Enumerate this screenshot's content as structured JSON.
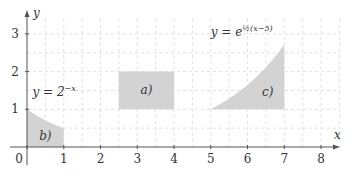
{
  "chart_data": {
    "type": "area",
    "title": "",
    "xlabel": "x",
    "ylabel": "y",
    "xlim": [
      0,
      8.5
    ],
    "ylim": [
      0,
      3.4
    ],
    "x_ticks": [
      "0",
      "1",
      "2",
      "3",
      "4",
      "5",
      "6",
      "7",
      "8"
    ],
    "y_ticks": [
      "1",
      "2",
      "3"
    ],
    "grid": {
      "on": true,
      "style": "dashed",
      "step": 0.5
    },
    "colors": {
      "fill": "#d3d3d3",
      "grid": "#e0e0e0",
      "axis": "#555555"
    },
    "regions": [
      {
        "label": "a)",
        "shape": "rectangle",
        "x": [
          2.5,
          4
        ],
        "y": [
          1,
          2
        ]
      },
      {
        "label": "b)",
        "shape": "under-curve",
        "curve": "y = 2^-x",
        "x": [
          0,
          1
        ],
        "y_bottom": 0
      },
      {
        "label": "c)",
        "shape": "between-curve-and-line",
        "curve": "y = e^(1/2 (x-5))",
        "x": [
          5,
          7
        ],
        "y_bottom": 1
      }
    ],
    "annotations": [
      {
        "text": "y = 2",
        "sup": "−x",
        "x": 0.15,
        "y": 1.35
      },
      {
        "text": "y = e",
        "sup": "½(x−5)",
        "x": 5.0,
        "y": 2.95
      }
    ]
  }
}
